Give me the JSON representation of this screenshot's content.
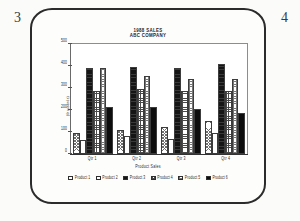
{
  "page": {
    "left_number": "3",
    "right_number": "4"
  },
  "chart_data": {
    "type": "bar",
    "title": "1988 SALES",
    "subtitle": "ABC COMPANY",
    "xlabel": "Product Sales",
    "ylabel": "(thousands)",
    "categories": [
      "Qtr 1",
      "Qtr 2",
      "Qtr 3",
      "Qtr 4"
    ],
    "yticks": [
      "0",
      "100",
      "200",
      "300",
      "400",
      "500"
    ],
    "ylim": [
      0,
      500
    ],
    "grid": false,
    "legend_position": "bottom",
    "series": [
      {
        "name": "Product 1",
        "fill": "f1",
        "values": [
          95,
          110,
          125,
          150
        ]
      },
      {
        "name": "Product 2",
        "fill": "f2",
        "values": [
          65,
          80,
          70,
          95
        ]
      },
      {
        "name": "Product 3",
        "fill": "f3",
        "values": [
          390,
          395,
          390,
          410
        ]
      },
      {
        "name": "Product 4",
        "fill": "f4",
        "values": [
          285,
          295,
          285,
          285
        ]
      },
      {
        "name": "Product 5",
        "fill": "f5",
        "values": [
          390,
          355,
          340,
          340
        ]
      },
      {
        "name": "Product 6",
        "fill": "f6",
        "values": [
          215,
          215,
          205,
          185
        ]
      }
    ]
  }
}
